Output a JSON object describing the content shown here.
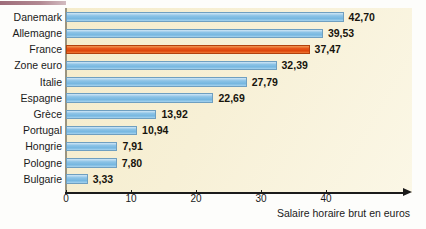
{
  "chart_data": {
    "type": "bar",
    "orientation": "horizontal",
    "title": "",
    "xlabel": "Salaire horaire brut en euros",
    "ylabel": "",
    "xlim": [
      0,
      46
    ],
    "xticks": [
      0,
      10,
      20,
      30,
      40
    ],
    "xtick_labels": [
      "0",
      "10",
      "20",
      "30",
      "40"
    ],
    "grid": false,
    "legend": null,
    "value_format": "comma-decimal",
    "categories": [
      "Danemark",
      "Allemagne",
      "France",
      "Zone euro",
      "Italie",
      "Espagne",
      "Grèce",
      "Portugal",
      "Hongrie",
      "Pologne",
      "Bulgarie"
    ],
    "values": [
      42.7,
      39.53,
      37.47,
      32.39,
      27.79,
      22.69,
      13.92,
      10.94,
      7.91,
      7.8,
      3.33
    ],
    "value_labels": [
      "42,70",
      "39,53",
      "37,47",
      "32,39",
      "27,79",
      "22,69",
      "13,92",
      "10,94",
      "7,91",
      "7,80",
      "3,33"
    ],
    "highlight_index": 2,
    "colors": {
      "bar": "#8cc3e6",
      "bar_border": "#6f9fc0",
      "highlight_bar": "#dc4409",
      "highlight_bar_border": "#b2410d",
      "plot_background": "#f7f0d6",
      "axis": "#1b1b1b",
      "text": "#1a1a1a"
    }
  }
}
